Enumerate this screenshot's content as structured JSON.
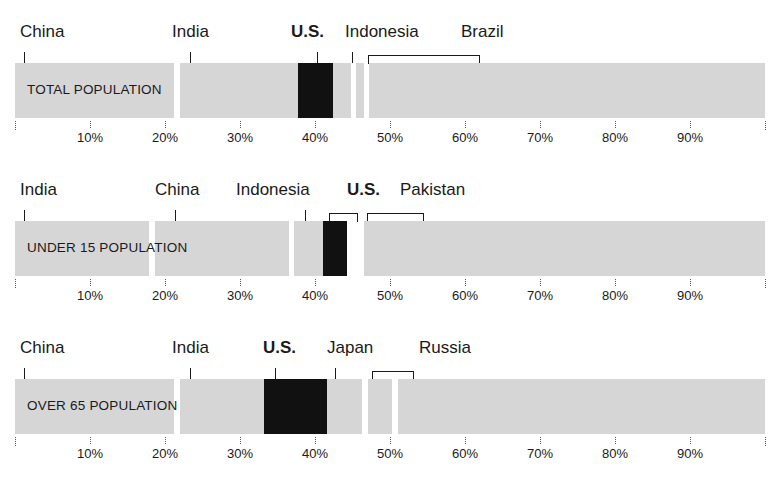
{
  "chart_data": {
    "type": "bar",
    "subtype": "stacked-100-percent",
    "title": "",
    "xlabel": "",
    "ylabel": "",
    "xlim": [
      0,
      100
    ],
    "grid": false,
    "legend": "none",
    "axis_ticks": [
      {
        "value": 0,
        "label": ""
      },
      {
        "value": 10,
        "label": "10%"
      },
      {
        "value": 20,
        "label": "20%"
      },
      {
        "value": 30,
        "label": "30%"
      },
      {
        "value": 40,
        "label": "40%"
      },
      {
        "value": 50,
        "label": "50%"
      },
      {
        "value": 60,
        "label": "60%"
      },
      {
        "value": 70,
        "label": "70%"
      },
      {
        "value": 80,
        "label": "80%"
      },
      {
        "value": 90,
        "label": "90%"
      },
      {
        "value": 100,
        "label": ""
      }
    ],
    "highlight_color": "#111111",
    "segment_color": "#d6d6d6",
    "rows": [
      {
        "caption": "TOTAL POPULATION",
        "segments": [
          {
            "name": "China",
            "start": 0.0,
            "end": 21.2,
            "highlight": false
          },
          {
            "name": "India",
            "start": 22.0,
            "end": 37.7,
            "highlight": false
          },
          {
            "name": "U.S.",
            "start": 37.7,
            "end": 42.4,
            "highlight": true
          },
          {
            "name": "Indonesia",
            "start": 42.4,
            "end": 44.8,
            "highlight": false
          },
          {
            "name": "unlabeled",
            "start": 45.5,
            "end": 46.5,
            "highlight": false
          },
          {
            "name": "Brazil",
            "start": 47.2,
            "end": 100.0,
            "highlight": false
          }
        ],
        "labels": [
          {
            "text": "China",
            "bold": false,
            "x": 20,
            "marker": "tick",
            "marker_x": 24,
            "marker_x2": null
          },
          {
            "text": "India",
            "bold": false,
            "x": 172,
            "marker": "tick",
            "marker_x": 190,
            "marker_x2": null
          },
          {
            "text": "U.S.",
            "bold": true,
            "x": 291,
            "marker": "tick",
            "marker_x": 317,
            "marker_x2": null
          },
          {
            "text": "Indonesia",
            "bold": false,
            "x": 345,
            "marker": "tick",
            "marker_x": 352,
            "marker_x2": null
          },
          {
            "text": "Brazil",
            "bold": false,
            "x": 461,
            "marker": "bracket",
            "marker_x": 368,
            "marker_x2": 478
          }
        ]
      },
      {
        "caption": "UNDER 15 POPULATION",
        "segments": [
          {
            "name": "India",
            "start": 0.0,
            "end": 17.8,
            "highlight": false
          },
          {
            "name": "China",
            "start": 18.6,
            "end": 36.5,
            "highlight": false
          },
          {
            "name": "Indonesia",
            "start": 37.2,
            "end": 41.0,
            "highlight": false
          },
          {
            "name": "U.S.",
            "start": 41.0,
            "end": 44.3,
            "highlight": true
          },
          {
            "name": "Pakistan",
            "start": 46.5,
            "end": 100.0,
            "highlight": false
          }
        ],
        "labels": [
          {
            "text": "India",
            "bold": false,
            "x": 20,
            "marker": "tick",
            "marker_x": 24,
            "marker_x2": null
          },
          {
            "text": "China",
            "bold": false,
            "x": 155,
            "marker": "tick",
            "marker_x": 175,
            "marker_x2": null
          },
          {
            "text": "Indonesia",
            "bold": false,
            "x": 236,
            "marker": "tick",
            "marker_x": 305,
            "marker_x2": null
          },
          {
            "text": "U.S.",
            "bold": true,
            "x": 347,
            "marker": "bracket",
            "marker_x": 329,
            "marker_x2": 356
          },
          {
            "text": "Pakistan",
            "bold": false,
            "x": 400,
            "marker": "bracket",
            "marker_x": 367,
            "marker_x2": 422
          }
        ]
      },
      {
        "caption": "OVER 65 POPULATION",
        "segments": [
          {
            "name": "China",
            "start": 0.0,
            "end": 21.2,
            "highlight": false
          },
          {
            "name": "India",
            "start": 22.0,
            "end": 33.2,
            "highlight": false
          },
          {
            "name": "U.S.",
            "start": 33.2,
            "end": 41.6,
            "highlight": true
          },
          {
            "name": "Japan",
            "start": 41.6,
            "end": 46.3,
            "highlight": false
          },
          {
            "name": "unlabeled",
            "start": 47.0,
            "end": 50.3,
            "highlight": false
          },
          {
            "name": "Russia",
            "start": 51.0,
            "end": 100.0,
            "highlight": false
          }
        ],
        "labels": [
          {
            "text": "China",
            "bold": false,
            "x": 20,
            "marker": "tick",
            "marker_x": 24,
            "marker_x2": null
          },
          {
            "text": "India",
            "bold": false,
            "x": 172,
            "marker": "tick",
            "marker_x": 190,
            "marker_x2": null
          },
          {
            "text": "U.S.",
            "bold": true,
            "x": 263,
            "marker": "tick",
            "marker_x": 275,
            "marker_x2": null
          },
          {
            "text": "Japan",
            "bold": false,
            "x": 327,
            "marker": "tick",
            "marker_x": 335,
            "marker_x2": null
          },
          {
            "text": "Russia",
            "bold": false,
            "x": 419,
            "marker": "bracket",
            "marker_x": 372,
            "marker_x2": 412
          }
        ]
      }
    ]
  }
}
